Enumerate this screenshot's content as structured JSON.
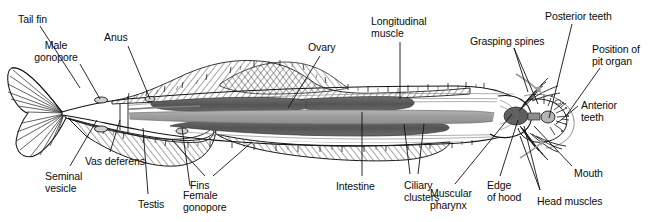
{
  "figure": {
    "width": 651,
    "height": 222,
    "background_color": "#ffffff",
    "ink_color": "#111111",
    "organ_dark_color": "#5a5a5a",
    "organ_mid_color": "#9a9a9a",
    "organ_light_color": "#c9c9c9"
  },
  "labels": [
    {
      "id": "tail-fin",
      "text": "Tail fin",
      "x": 18,
      "y": 14,
      "align": "l"
    },
    {
      "id": "male-gonopore",
      "text": "Male\ngonopore",
      "x": 56,
      "y": 40,
      "align": "c"
    },
    {
      "id": "anus",
      "text": "Anus",
      "x": 104,
      "y": 32,
      "align": "l"
    },
    {
      "id": "ovary",
      "text": "Ovary",
      "x": 308,
      "y": 42,
      "align": "l"
    },
    {
      "id": "longitudinal-muscle",
      "text": "Longitudinal\nmuscle",
      "x": 371,
      "y": 16,
      "align": "l"
    },
    {
      "id": "grasping-spines",
      "text": "Grasping spines",
      "x": 470,
      "y": 36,
      "align": "l"
    },
    {
      "id": "posterior-teeth",
      "text": "Posterior teeth",
      "x": 545,
      "y": 11,
      "align": "l"
    },
    {
      "id": "position-of-pit-organ",
      "text": "Position of\npit organ",
      "x": 592,
      "y": 44,
      "align": "l"
    },
    {
      "id": "anterior-teeth",
      "text": "Anterior\nteeth",
      "x": 581,
      "y": 100,
      "align": "l"
    },
    {
      "id": "mouth",
      "text": "Mouth",
      "x": 574,
      "y": 168,
      "align": "l"
    },
    {
      "id": "head-muscles",
      "text": "Head muscles",
      "x": 537,
      "y": 196,
      "align": "l"
    },
    {
      "id": "edge-of-hood",
      "text": "Edge\nof hood",
      "x": 487,
      "y": 180,
      "align": "l"
    },
    {
      "id": "muscular-pharynx",
      "text": "Muscular\npharynx",
      "x": 430,
      "y": 188,
      "align": "l"
    },
    {
      "id": "ciliary-clusters",
      "text": "Ciliary\nclusters",
      "x": 404,
      "y": 180,
      "align": "l"
    },
    {
      "id": "intestine",
      "text": "Intestine",
      "x": 336,
      "y": 181,
      "align": "l"
    },
    {
      "id": "fins",
      "text": "Fins",
      "x": 190,
      "y": 180,
      "align": "l"
    },
    {
      "id": "female-gonopore",
      "text": "Female\ngonopore",
      "x": 183,
      "y": 190,
      "align": "l"
    },
    {
      "id": "testis",
      "text": "Testis",
      "x": 138,
      "y": 199,
      "align": "l"
    },
    {
      "id": "vas-deferens",
      "text": "Vas deferens",
      "x": 85,
      "y": 156,
      "align": "l"
    },
    {
      "id": "seminal-vesicle",
      "text": "Seminal\nvesicle",
      "x": 45,
      "y": 171,
      "align": "l"
    }
  ],
  "leaders": [
    {
      "id": "tail-fin-leader",
      "points": "40,26 80,88"
    },
    {
      "id": "male-gonopore-leader",
      "points": "80,64 100,99"
    },
    {
      "id": "anus-leader",
      "points": "128,46 150,99"
    },
    {
      "id": "ovary-leader",
      "points": "320,56 288,108"
    },
    {
      "id": "longitudinal-muscle-leader",
      "points": "400,42 400,99"
    },
    {
      "id": "grasping-spines-leader-1",
      "points": "514,48 528,92"
    },
    {
      "id": "grasping-spines-leader-2",
      "points": "514,48 538,104"
    },
    {
      "id": "posterior-teeth-leader",
      "points": "572,24 549,118"
    },
    {
      "id": "pit-organ-leader",
      "points": "600,68 566,116"
    },
    {
      "id": "anterior-teeth-leader",
      "points": "578,106 556,124"
    },
    {
      "id": "mouth-leader",
      "points": "572,166 534,126"
    },
    {
      "id": "head-muscles-leader-1",
      "points": "540,190 524,126"
    },
    {
      "id": "head-muscles-leader-2",
      "points": "540,190 520,136"
    },
    {
      "id": "edge-of-hood-leader",
      "points": "500,176 518,120"
    },
    {
      "id": "muscular-pharynx-leader",
      "points": "455,184 512,114"
    },
    {
      "id": "ciliary-clusters-leader-1",
      "points": "410,174 404,124"
    },
    {
      "id": "ciliary-clusters-leader-2",
      "points": "418,174 424,124"
    },
    {
      "id": "intestine-leader",
      "points": "362,176 362,112"
    },
    {
      "id": "fins-leader-1",
      "points": "205,176 172,140"
    },
    {
      "id": "fins-leader-2",
      "points": "213,176 252,142"
    },
    {
      "id": "female-gonopore-leader",
      "points": "190,186 182,128"
    },
    {
      "id": "testis-leader",
      "points": "148,194 143,128"
    },
    {
      "id": "vas-deferens-leader",
      "points": "110,152 120,120"
    },
    {
      "id": "seminal-vesicle-leader",
      "points": "70,166 97,120"
    }
  ]
}
